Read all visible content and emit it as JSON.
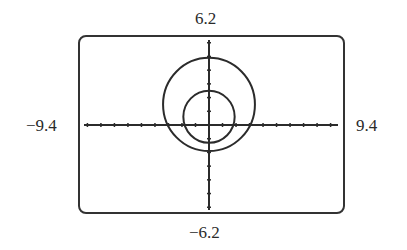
{
  "chart_data": {
    "type": "line",
    "title": "",
    "xlabel": "",
    "ylabel": "",
    "window": {
      "xmin": -9.4,
      "xmax": 9.4,
      "ymin": -6.2,
      "ymax": 6.2,
      "xscl": 1,
      "yscl": 1
    },
    "tick_labels": {
      "top": "6.2",
      "bottom": "−6.2",
      "left": "−9.4",
      "right": "9.4"
    },
    "grid": false,
    "legend": null,
    "series": [
      {
        "name": "outer-curve",
        "shape": "circle",
        "center": [
          0,
          1.5
        ],
        "radius": 3.4
      },
      {
        "name": "inner-curve",
        "shape": "circle",
        "center": [
          0,
          0.6
        ],
        "radius": 1.9
      }
    ]
  },
  "colors": {
    "curve": "#2b2b2b",
    "axis": "#2b2b2b",
    "frame": "#333333",
    "background": "#ffffff"
  }
}
